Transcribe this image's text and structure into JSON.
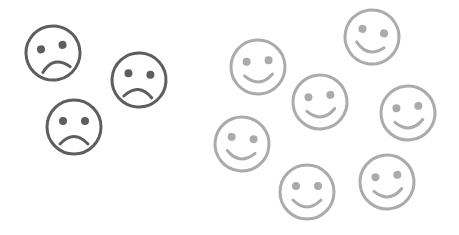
{
  "canvas": {
    "width": 459,
    "height": 235,
    "background": "#ffffff"
  },
  "colors": {
    "sad": "#5e5e5e",
    "happy": "#ababab"
  },
  "faces": [
    {
      "type": "sad",
      "cx": 53,
      "cy": 53,
      "r": 27,
      "tilt": -12
    },
    {
      "type": "sad",
      "cx": 139,
      "cy": 80,
      "r": 27,
      "tilt": 4
    },
    {
      "type": "sad",
      "cx": 74,
      "cy": 127,
      "r": 27,
      "tilt": 0
    },
    {
      "type": "happy",
      "cx": 372,
      "cy": 37,
      "r": 27,
      "tilt": 12
    },
    {
      "type": "happy",
      "cx": 258,
      "cy": 67,
      "r": 27,
      "tilt": -4
    },
    {
      "type": "happy",
      "cx": 320,
      "cy": 102,
      "r": 27,
      "tilt": -6
    },
    {
      "type": "happy",
      "cx": 408,
      "cy": 113,
      "r": 27,
      "tilt": -6
    },
    {
      "type": "happy",
      "cx": 242,
      "cy": 144,
      "r": 27,
      "tilt": 6
    },
    {
      "type": "happy",
      "cx": 307,
      "cy": 192,
      "r": 27,
      "tilt": 0
    },
    {
      "type": "happy",
      "cx": 387,
      "cy": 182,
      "r": 27,
      "tilt": -6
    }
  ]
}
